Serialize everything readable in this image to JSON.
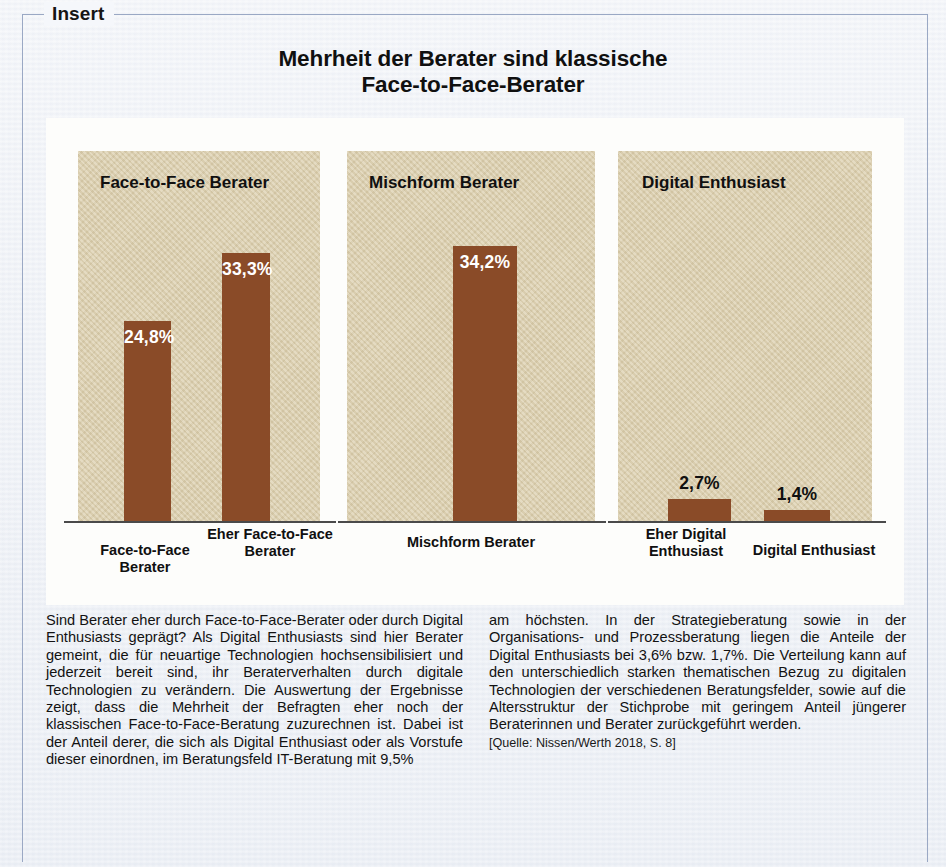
{
  "frame": {
    "legend": "Insert"
  },
  "title": {
    "line1": "Mehrheit der Berater sind klassische",
    "line2": "Face-to-Face-Berater"
  },
  "chart_data": {
    "type": "bar",
    "title": "Mehrheit der Berater sind klassische Face-to-Face-Berater",
    "xlabel": "",
    "ylabel": "",
    "ylim": [
      0,
      40
    ],
    "grid": false,
    "legend_position": "none",
    "value_suffix": "%",
    "decimal_separator": ",",
    "bar_color": "#8a4b28",
    "panel_color": "#dccfae",
    "groups": [
      {
        "name": "Face-to-Face Berater",
        "panel_title": "Face-to-Face Berater",
        "categories": [
          "Face-to-Face Berater",
          "Eher Face-to-Face Berater"
        ],
        "values": [
          24.8,
          33.3
        ],
        "labels": [
          "24,8%",
          "33,3%"
        ]
      },
      {
        "name": "Mischform Berater",
        "panel_title": "Mischform Berater",
        "categories": [
          "Mischform Berater"
        ],
        "values": [
          34.2
        ],
        "labels": [
          "34,2%"
        ]
      },
      {
        "name": "Digital Enthusiast",
        "panel_title": "Digital Enthusiast",
        "categories": [
          "Eher Digital Enthusiast",
          "Digital Enthusiast"
        ],
        "values": [
          2.7,
          1.4
        ],
        "labels": [
          "2,7%",
          "1,4%"
        ]
      }
    ]
  },
  "body": {
    "column_left": "Sind Berater eher durch Face-to-Face-Berater oder durch Digital Enthusiasts geprägt? Als Digital Enthusiasts sind hier Berater gemeint, die für neuartige Technologien hochsensibilisiert und jederzeit bereit sind, ihr Beraterverhalten durch digitale Technologien zu verändern. Die Auswertung der Ergebnisse zeigt, dass die Mehrheit der Befragten eher noch der klassischen Face-to-Face-Beratung zuzurechnen ist. Dabei ist der Anteil derer, die sich als Digital Enthusiast oder als Vorstufe dieser einordnen, im Beratungsfeld IT-Beratung mit 9,5%",
    "column_right": "am höchsten. In der Strategieberatung sowie in der Organisations- und Prozessberatung liegen die Anteile der Digital Enthusiasts bei 3,6% bzw. 1,7%. Die Verteilung kann auf den unterschiedlich starken thematischen Bezug zu digitalen Technologien der verschiedenen Beratungsfelder, sowie auf die Altersstruktur der Stichprobe mit geringem Anteil jüngerer Beraterinnen und Berater zurückgeführt werden.",
    "source": "[Quelle: Nissen/Werth 2018, S. 8]"
  }
}
